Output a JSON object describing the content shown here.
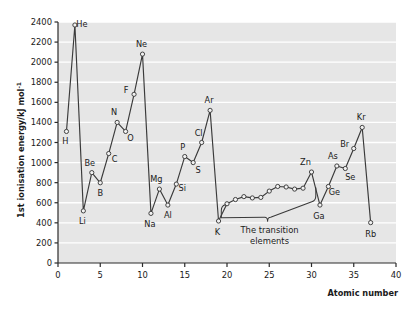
{
  "chart_data": {
    "type": "line",
    "title": "",
    "xlabel": "Atomic number",
    "ylabel": "1st ionisation energy/kJ mol",
    "ylabel_superscript": "-1",
    "xlim": [
      0,
      40
    ],
    "ylim": [
      0,
      2400
    ],
    "xticks": [
      0,
      5,
      10,
      15,
      20,
      25,
      30,
      35,
      40
    ],
    "yticks": [
      0,
      200,
      400,
      600,
      800,
      1000,
      1200,
      1400,
      1600,
      1800,
      2000,
      2200,
      2400
    ],
    "grid": "horizontal-white",
    "legend": "none",
    "marker": "open-circle",
    "series": [
      {
        "name": "First ionisation energy",
        "x": [
          1,
          2,
          3,
          4,
          5,
          6,
          7,
          8,
          9,
          10,
          11,
          12,
          13,
          14,
          15,
          16,
          17,
          18,
          19,
          20,
          21,
          22,
          23,
          24,
          25,
          26,
          27,
          28,
          29,
          30,
          31,
          32,
          33,
          34,
          35,
          36,
          37
        ],
        "values": [
          1310,
          2370,
          519,
          900,
          799,
          1090,
          1400,
          1310,
          1680,
          2080,
          494,
          736,
          577,
          786,
          1060,
          1000,
          1200,
          1520,
          418,
          590,
          632,
          661,
          648,
          653,
          716,
          762,
          757,
          736,
          745,
          906,
          577,
          762,
          966,
          941,
          1140,
          1350,
          402
        ]
      }
    ],
    "point_labels": [
      {
        "symbol": "H",
        "z": 1,
        "value": 1310,
        "dx": -1,
        "dy": 13
      },
      {
        "symbol": "He",
        "z": 2,
        "value": 2370,
        "dx": 7,
        "dy": 2
      },
      {
        "symbol": "Li",
        "z": 3,
        "value": 519,
        "dx": -1,
        "dy": 13
      },
      {
        "symbol": "Be",
        "z": 4,
        "value": 900,
        "dx": -2,
        "dy": -7
      },
      {
        "symbol": "B",
        "z": 5,
        "value": 799,
        "dx": 0,
        "dy": 13
      },
      {
        "symbol": "C",
        "z": 6,
        "value": 1090,
        "dx": 6,
        "dy": 8
      },
      {
        "symbol": "N",
        "z": 7,
        "value": 1400,
        "dx": -3,
        "dy": -7
      },
      {
        "symbol": "O",
        "z": 8,
        "value": 1310,
        "dx": 5,
        "dy": 10
      },
      {
        "symbol": "F",
        "z": 9,
        "value": 1680,
        "dx": -8,
        "dy": -1
      },
      {
        "symbol": "Ne",
        "z": 10,
        "value": 2080,
        "dx": -1,
        "dy": -7
      },
      {
        "symbol": "Na",
        "z": 11,
        "value": 494,
        "dx": -1,
        "dy": 14
      },
      {
        "symbol": "Mg",
        "z": 12,
        "value": 736,
        "dx": -3,
        "dy": -7
      },
      {
        "symbol": "Al",
        "z": 13,
        "value": 577,
        "dx": 0,
        "dy": 13
      },
      {
        "symbol": "Si",
        "z": 14,
        "value": 786,
        "dx": 6,
        "dy": 7
      },
      {
        "symbol": "P",
        "z": 15,
        "value": 1060,
        "dx": -2,
        "dy": -7
      },
      {
        "symbol": "S",
        "z": 16,
        "value": 1000,
        "dx": 5,
        "dy": 10
      },
      {
        "symbol": "Cl",
        "z": 17,
        "value": 1200,
        "dx": -3,
        "dy": -7
      },
      {
        "symbol": "Ar",
        "z": 18,
        "value": 1520,
        "dx": -1,
        "dy": -7
      },
      {
        "symbol": "K",
        "z": 19,
        "value": 418,
        "dx": -1,
        "dy": 14
      },
      {
        "symbol": "Zn",
        "z": 30,
        "value": 906,
        "dx": -6,
        "dy": -7
      },
      {
        "symbol": "Ga",
        "z": 31,
        "value": 577,
        "dx": -1,
        "dy": 14
      },
      {
        "symbol": "Ge",
        "z": 32,
        "value": 762,
        "dx": 6,
        "dy": 9
      },
      {
        "symbol": "As",
        "z": 33,
        "value": 966,
        "dx": -4,
        "dy": -7
      },
      {
        "symbol": "Se",
        "z": 34,
        "value": 941,
        "dx": 5,
        "dy": 11
      },
      {
        "symbol": "Br",
        "z": 35,
        "value": 1140,
        "dx": -9,
        "dy": -2
      },
      {
        "symbol": "Kr",
        "z": 36,
        "value": 1350,
        "dx": -1,
        "dy": -7
      },
      {
        "symbol": "Rb",
        "z": 37,
        "value": 402,
        "dx": 0,
        "dy": 14
      }
    ],
    "annotations": [
      {
        "name": "transition-elements",
        "line1": "The transition",
        "line2": "elements",
        "brace_from_z": 19.8,
        "brace_to_z": 29.8
      }
    ],
    "colors": {
      "plot_background": "#e6e6e6",
      "gridline": "#ffffff",
      "series_line": "#3a3a3a",
      "marker_fill": "#f2f2f2",
      "marker_stroke": "#3a3a3a",
      "axis": "#2b2b2b",
      "text": "#1a1a1a",
      "page_background": "#ffffff"
    }
  }
}
